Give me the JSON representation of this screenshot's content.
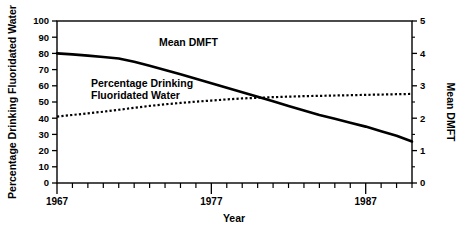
{
  "chart_data": {
    "type": "line",
    "title": "",
    "xlabel": "Year",
    "ylabel": "Percentage Drinking Fluoridated Water",
    "y2label": "Mean DMFT",
    "xlim": [
      1967,
      1990
    ],
    "ylim": [
      0,
      100
    ],
    "y2lim": [
      0,
      5
    ],
    "grid": false,
    "legend_position": "inline-annotations",
    "x_tick_labels": [
      "1967",
      "1977",
      "1987"
    ],
    "x_tick_values": [
      1967,
      1977,
      1987
    ],
    "x_minor_ticks": [
      1968,
      1969,
      1970,
      1971,
      1972,
      1973,
      1974,
      1975,
      1976,
      1978,
      1979,
      1980,
      1981,
      1982,
      1983,
      1984,
      1985,
      1986,
      1988,
      1989,
      1990
    ],
    "y_tick_labels": [
      "0",
      "10",
      "20",
      "30",
      "40",
      "50",
      "60",
      "70",
      "80",
      "90",
      "100"
    ],
    "y_tick_values": [
      0,
      10,
      20,
      30,
      40,
      50,
      60,
      70,
      80,
      90,
      100
    ],
    "y2_tick_labels": [
      "0",
      "1",
      "2",
      "3",
      "4",
      "5"
    ],
    "y2_tick_values": [
      0,
      1,
      2,
      3,
      4,
      5
    ],
    "y2_minor_ticks": [
      0.5,
      1.5,
      2.5,
      3.5,
      4.5
    ],
    "series": [
      {
        "name": "Mean DMFT",
        "axis": "right",
        "style": "solid",
        "color": "#000000",
        "annotation": "Mean DMFT",
        "x": [
          1967,
          1968,
          1969,
          1970,
          1971,
          1972,
          1973,
          1974,
          1975,
          1976,
          1977,
          1978,
          1979,
          1980,
          1981,
          1982,
          1983,
          1984,
          1985,
          1986,
          1987,
          1988,
          1989,
          1990
        ],
        "values": [
          4.0,
          3.97,
          3.93,
          3.89,
          3.84,
          3.74,
          3.62,
          3.49,
          3.36,
          3.22,
          3.08,
          2.94,
          2.8,
          2.66,
          2.52,
          2.38,
          2.24,
          2.1,
          1.98,
          1.86,
          1.74,
          1.6,
          1.46,
          1.28
        ]
      },
      {
        "name": "Percentage Drinking Fluoridated Water",
        "axis": "left",
        "style": "dotted",
        "color": "#000000",
        "annotation": "Percentage Drinking\nFluoridated Water",
        "x": [
          1967,
          1968,
          1969,
          1970,
          1971,
          1972,
          1973,
          1974,
          1975,
          1976,
          1977,
          1978,
          1979,
          1980,
          1981,
          1982,
          1983,
          1984,
          1985,
          1986,
          1987,
          1988,
          1989,
          1990
        ],
        "values": [
          41.0,
          42.0,
          43.0,
          44.0,
          45.2,
          46.4,
          47.6,
          48.6,
          49.4,
          50.2,
          50.9,
          51.6,
          52.2,
          52.6,
          53.0,
          53.3,
          53.6,
          53.8,
          54.0,
          54.2,
          54.4,
          54.6,
          54.8,
          55.0
        ]
      }
    ],
    "annotations": [
      {
        "text": "Mean DMFT",
        "x": 1973.6,
        "y_px": 46
      },
      {
        "text": "Percentage Drinking",
        "x": 1969.2,
        "y_px": 87
      },
      {
        "text": "Fluoridated Water",
        "x": 1969.2,
        "y_px": 99
      }
    ]
  }
}
